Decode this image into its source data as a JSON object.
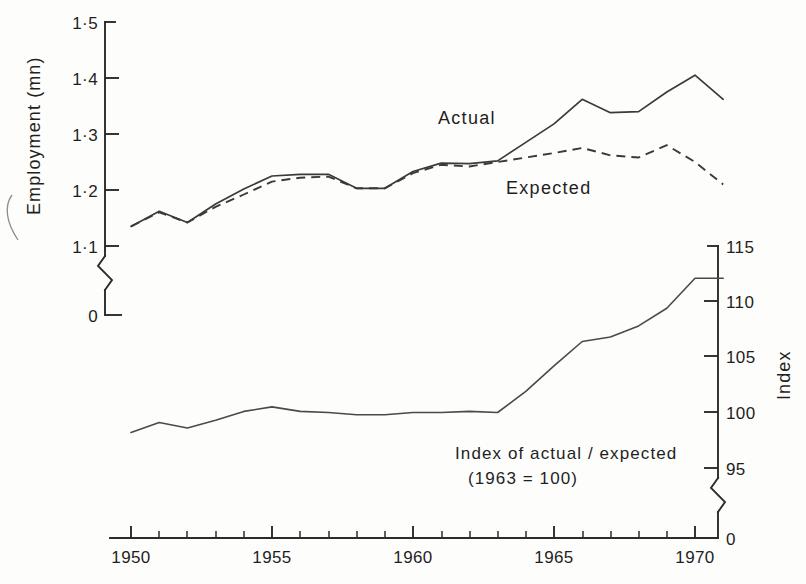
{
  "chart_data": {
    "type": "line",
    "title": "",
    "xlabel": "",
    "ylabel": "Employment (mn)",
    "y2label": "Index",
    "xlim": [
      1950,
      1971
    ],
    "ylim": [
      1.1,
      1.5
    ],
    "y2lim": [
      95,
      115
    ],
    "grid": false,
    "legend_position": "inline-annotations",
    "x": [
      1950,
      1951,
      1952,
      1953,
      1954,
      1955,
      1956,
      1957,
      1958,
      1959,
      1960,
      1961,
      1962,
      1963,
      1964,
      1965,
      1966,
      1967,
      1968,
      1969,
      1970,
      1971
    ],
    "xticks_major": [
      1950,
      1955,
      1960,
      1965,
      1970
    ],
    "xticklabels": [
      "1950",
      "1955",
      "1960",
      "1965",
      "1970"
    ],
    "yticks": [
      1.1,
      1.2,
      1.3,
      1.4,
      1.5
    ],
    "yticklabels": [
      "1·1",
      "1·2",
      "1·3",
      "1·4",
      "1·5"
    ],
    "y_zero_label": "0",
    "y_axis_break": true,
    "y2ticks": [
      95,
      100,
      105,
      110,
      115
    ],
    "y2ticklabels": [
      "95",
      "100",
      "105",
      "110",
      "115"
    ],
    "y2_zero_label": "0",
    "y2_axis_break": true,
    "series": [
      {
        "name": "Actual",
        "style": "solid",
        "axis": "left",
        "values": [
          1.135,
          1.162,
          1.142,
          1.175,
          1.202,
          1.225,
          1.228,
          1.228,
          1.203,
          1.203,
          1.233,
          1.248,
          1.247,
          1.252,
          1.285,
          1.318,
          1.362,
          1.338,
          1.34,
          1.375,
          1.405,
          1.362
        ]
      },
      {
        "name": "Expected",
        "style": "dashed",
        "axis": "left",
        "values": [
          1.135,
          1.16,
          1.142,
          1.17,
          1.192,
          1.215,
          1.222,
          1.224,
          1.203,
          1.203,
          1.23,
          1.245,
          1.242,
          1.25,
          1.258,
          1.266,
          1.275,
          1.262,
          1.258,
          1.28,
          1.25,
          1.21
        ]
      },
      {
        "name": "Index of actual/expected",
        "style": "solid",
        "axis": "right",
        "values": [
          98.2,
          99.1,
          98.6,
          99.3,
          100.1,
          100.5,
          100.1,
          100.0,
          99.8,
          99.8,
          100.0,
          100.0,
          100.1,
          100.0,
          101.9,
          104.2,
          106.4,
          106.8,
          107.8,
          109.4,
          112.1,
          112.1
        ]
      }
    ],
    "annotations": [
      {
        "name": "actual-label",
        "text": "Actual",
        "x": 1960.3,
        "y": 1.318
      },
      {
        "name": "expected-label",
        "text": "Expected",
        "x": 1962.2,
        "y": 1.208
      },
      {
        "name": "index-caption-line1",
        "text": "Index of actual / expected",
        "x": 1964.0,
        "y": 96.5
      },
      {
        "name": "index-caption-line2",
        "text": "(1963 = 100)",
        "x": 1964.5,
        "y": 95.2
      }
    ]
  },
  "axes": {
    "left": {
      "title": "Employment (mn)",
      "ticks": [
        "1·5",
        "1·4",
        "1·3",
        "1·2",
        "1·1"
      ],
      "zero": "0"
    },
    "right": {
      "title": "Index",
      "ticks": [
        "115",
        "110",
        "105",
        "100",
        "95"
      ],
      "zero": "0"
    },
    "bottom": {
      "ticks": [
        "1950",
        "1955",
        "1960",
        "1965",
        "1970"
      ]
    }
  },
  "labels": {
    "actual": "Actual",
    "expected": "Expected",
    "index_caption_1": "Index of actual / expected",
    "index_caption_2": "(1963 = 100)"
  },
  "colors": {
    "ink": "#2b2b2b",
    "background": "#fdfdfc",
    "series_line": "#3a3a3a"
  }
}
